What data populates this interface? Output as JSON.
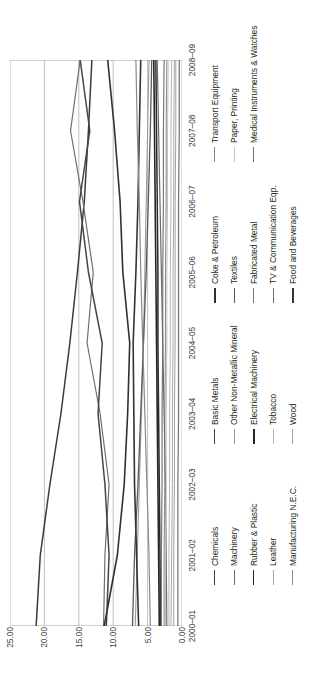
{
  "chart_data": {
    "type": "line",
    "title": "",
    "xlabel": "",
    "ylabel": "",
    "ylim": [
      0,
      25
    ],
    "yticks": [
      "0.00",
      "5.00",
      "10.00",
      "15.00",
      "20.00",
      "25.00"
    ],
    "grid": true,
    "legend_position": "bottom",
    "legend_columns": 4,
    "orientation": "rotated-90",
    "categories": [
      "2000–01",
      "2001–02",
      "2002–03",
      "2003–04",
      "2004–05",
      "2005–06",
      "2006–07",
      "2007–08",
      "2008–09"
    ],
    "series": [
      {
        "name": "Chemicals",
        "color": "#3a3a3a",
        "width": 1.5,
        "values": [
          21.2,
          20.6,
          19.2,
          17.6,
          16.3,
          15.2,
          14.2,
          13.6,
          13.1
        ]
      },
      {
        "name": "Machinery",
        "color": "#6e6e6e",
        "width": 1.2,
        "values": [
          11.4,
          11.2,
          10.6,
          11.9,
          13.8,
          12.9,
          14.4,
          16.2,
          14.8
        ]
      },
      {
        "name": "Rubber & Plastic",
        "color": "#2b2b2b",
        "width": 1.5,
        "values": [
          3.1,
          3.2,
          3.3,
          3.4,
          3.5,
          3.5,
          3.6,
          3.7,
          3.8
        ]
      },
      {
        "name": "Leather",
        "color": "#a8a8a8",
        "width": 1.0,
        "values": [
          1.6,
          1.5,
          1.4,
          1.4,
          1.3,
          1.3,
          1.2,
          1.2,
          1.1
        ]
      },
      {
        "name": "Manufacturing N.E.C.",
        "color": "#8c8c8c",
        "width": 1.1,
        "values": [
          2.6,
          2.6,
          2.5,
          2.5,
          2.4,
          2.4,
          2.3,
          2.3,
          2.2
        ]
      },
      {
        "name": "Basic Metals",
        "color": "#454545",
        "width": 1.5,
        "values": [
          11.0,
          10.6,
          11.2,
          12.2,
          11.6,
          13.6,
          14.9,
          13.4,
          14.8
        ]
      },
      {
        "name": "Other Non-Metallic Mineral",
        "color": "#9a9a9a",
        "width": 1.1,
        "values": [
          6.8,
          6.5,
          6.2,
          5.9,
          5.6,
          5.4,
          5.2,
          5.0,
          4.8
        ]
      },
      {
        "name": "Electrical Machinery",
        "color": "#262626",
        "width": 1.6,
        "values": [
          3.3,
          3.4,
          3.5,
          3.6,
          3.7,
          3.8,
          3.9,
          4.0,
          4.1
        ]
      },
      {
        "name": "Tobacco",
        "color": "#b5b5b5",
        "width": 1.0,
        "values": [
          1.9,
          1.9,
          1.8,
          1.8,
          1.7,
          1.7,
          1.6,
          1.6,
          1.5
        ]
      },
      {
        "name": "Wood",
        "color": "#a0a0a0",
        "width": 1.0,
        "values": [
          1.2,
          1.2,
          1.1,
          1.1,
          1.0,
          1.0,
          1.0,
          0.9,
          0.9
        ]
      },
      {
        "name": "Coke & Petroleum",
        "color": "#303030",
        "width": 1.6,
        "values": [
          11.3,
          9.4,
          8.4,
          7.9,
          7.6,
          8.6,
          9.0,
          9.8,
          10.8
        ]
      },
      {
        "name": "Textiles",
        "color": "#5a5a5a",
        "width": 1.3,
        "values": [
          7.2,
          6.9,
          6.4,
          6.0,
          5.6,
          5.2,
          4.9,
          4.6,
          4.4
        ]
      },
      {
        "name": "Fabricated Metal",
        "color": "#787878",
        "width": 1.2,
        "values": [
          3.0,
          3.0,
          2.9,
          2.9,
          2.8,
          2.8,
          2.7,
          2.7,
          2.6
        ]
      },
      {
        "name": "TV & Communication Eqp.",
        "color": "#6b6b6b",
        "width": 1.2,
        "values": [
          2.2,
          2.3,
          2.4,
          2.6,
          2.8,
          3.0,
          3.2,
          3.4,
          3.6
        ]
      },
      {
        "name": "Food and Beverages",
        "color": "#333333",
        "width": 1.6,
        "values": [
          6.3,
          6.6,
          6.9,
          7.0,
          7.1,
          6.7,
          6.4,
          6.2,
          6.0
        ]
      },
      {
        "name": "Transport Equipment",
        "color": "#8a8a8a",
        "width": 1.2,
        "values": [
          4.6,
          4.8,
          5.1,
          5.4,
          5.7,
          6.0,
          6.2,
          6.5,
          6.7
        ]
      },
      {
        "name": "Paper, Printing",
        "color": "#c2c2c2",
        "width": 1.0,
        "values": [
          2.4,
          2.4,
          2.3,
          2.3,
          2.2,
          2.2,
          2.1,
          2.1,
          2.0
        ]
      },
      {
        "name": "Medical Instruments & Watches",
        "color": "#707070",
        "width": 1.2,
        "values": [
          0.6,
          0.6,
          0.6,
          0.5,
          0.5,
          0.5,
          0.5,
          0.4,
          0.4
        ]
      }
    ]
  },
  "axis": {
    "y_ticks": [
      "25.00",
      "20.00",
      "15.00",
      "10.00",
      "5.00",
      "0.00"
    ],
    "x_ticks": [
      "2000–01",
      "2001–02",
      "2002–03",
      "2003–04",
      "2004–05",
      "2005–06",
      "2006–07",
      "2007–08",
      "2008–09"
    ]
  },
  "legend": {
    "items": [
      {
        "label": "Chemicals"
      },
      {
        "label": "Machinery"
      },
      {
        "label": "Rubber & Plastic"
      },
      {
        "label": "Leather"
      },
      {
        "label": "Manufacturing N.E.C."
      },
      {
        "label": "Basic Metals"
      },
      {
        "label": "Other Non-Metallic Mineral"
      },
      {
        "label": "Electrical Machinery"
      },
      {
        "label": "Tobacco"
      },
      {
        "label": "Wood"
      },
      {
        "label": "Coke & Petroleum"
      },
      {
        "label": "Textiles"
      },
      {
        "label": "Fabricated Metal"
      },
      {
        "label": "TV & Communication Eqp."
      },
      {
        "label": "Food and Beverages"
      },
      {
        "label": "Transport Equipment"
      },
      {
        "label": "Paper, Printing"
      },
      {
        "label": "Medical Instruments & Watches"
      }
    ]
  },
  "colors": {
    "gridline": "#b9b9b9",
    "frame": "#9a9a9a",
    "text": "#3a3a3a",
    "background": "#ffffff"
  }
}
